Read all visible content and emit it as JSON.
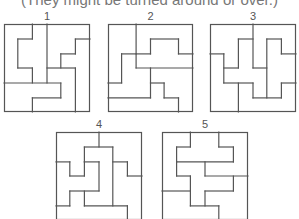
{
  "caption": "(They might be turned around or over.)",
  "line_color": "#555555",
  "puzzles": [
    {
      "label": "1",
      "box": {
        "x": 4,
        "y": 24,
        "w": 86,
        "h": 88
      },
      "lines": [
        [
          33,
          0,
          33,
          17
        ],
        [
          16,
          17,
          33,
          17
        ],
        [
          16,
          17,
          16,
          50
        ],
        [
          16,
          50,
          33,
          50
        ],
        [
          33,
          50,
          33,
          67
        ],
        [
          50,
          0,
          50,
          67
        ],
        [
          0,
          67,
          66,
          67
        ],
        [
          66,
          67,
          66,
          84
        ],
        [
          33,
          84,
          66,
          84
        ],
        [
          33,
          84,
          33,
          100
        ],
        [
          50,
          50,
          83,
          50
        ],
        [
          83,
          50,
          83,
          100
        ],
        [
          83,
          17,
          100,
          17
        ],
        [
          83,
          17,
          83,
          34
        ],
        [
          66,
          34,
          83,
          34
        ],
        [
          66,
          34,
          66,
          50
        ]
      ]
    },
    {
      "label": "2",
      "box": {
        "x": 108,
        "y": 24,
        "w": 85,
        "h": 88
      },
      "lines": [
        [
          33,
          0,
          33,
          50
        ],
        [
          33,
          50,
          100,
          50
        ],
        [
          50,
          17,
          83,
          17
        ],
        [
          50,
          17,
          50,
          34
        ],
        [
          33,
          34,
          50,
          34
        ],
        [
          16,
          34,
          33,
          34
        ],
        [
          16,
          34,
          16,
          67
        ],
        [
          0,
          67,
          16,
          67
        ],
        [
          83,
          17,
          83,
          34
        ],
        [
          83,
          34,
          100,
          34
        ],
        [
          50,
          50,
          50,
          84
        ],
        [
          0,
          84,
          50,
          84
        ],
        [
          50,
          67,
          66,
          67
        ],
        [
          66,
          67,
          66,
          84
        ],
        [
          66,
          84,
          83,
          84
        ],
        [
          83,
          84,
          83,
          100
        ]
      ]
    },
    {
      "label": "3",
      "box": {
        "x": 210,
        "y": 24,
        "w": 86,
        "h": 88
      },
      "lines": [
        [
          50,
          0,
          50,
          50
        ],
        [
          0,
          34,
          16,
          34
        ],
        [
          16,
          34,
          16,
          67
        ],
        [
          16,
          67,
          50,
          67
        ],
        [
          50,
          67,
          50,
          84
        ],
        [
          50,
          84,
          83,
          84
        ],
        [
          83,
          67,
          83,
          84
        ],
        [
          83,
          67,
          100,
          67
        ],
        [
          33,
          67,
          33,
          100
        ],
        [
          16,
          50,
          33,
          50
        ],
        [
          33,
          17,
          33,
          50
        ],
        [
          33,
          17,
          50,
          17
        ],
        [
          50,
          50,
          66,
          50
        ],
        [
          66,
          17,
          66,
          84
        ],
        [
          66,
          17,
          83,
          17
        ],
        [
          83,
          17,
          83,
          34
        ],
        [
          83,
          34,
          100,
          34
        ]
      ]
    },
    {
      "label": "4",
      "box": {
        "x": 56,
        "y": 132,
        "w": 86,
        "h": 88
      },
      "lines": [
        [
          50,
          0,
          50,
          17
        ],
        [
          33,
          17,
          66,
          17
        ],
        [
          33,
          17,
          33,
          34
        ],
        [
          66,
          17,
          66,
          84
        ],
        [
          0,
          34,
          16,
          34
        ],
        [
          16,
          34,
          16,
          50
        ],
        [
          16,
          50,
          33,
          50
        ],
        [
          33,
          34,
          33,
          50
        ],
        [
          33,
          34,
          50,
          34
        ],
        [
          50,
          34,
          50,
          67
        ],
        [
          16,
          67,
          50,
          67
        ],
        [
          16,
          67,
          16,
          84
        ],
        [
          0,
          84,
          16,
          84
        ],
        [
          33,
          67,
          33,
          84
        ],
        [
          33,
          84,
          83,
          84
        ],
        [
          83,
          84,
          83,
          100
        ],
        [
          66,
          34,
          83,
          34
        ],
        [
          83,
          34,
          83,
          50
        ],
        [
          83,
          50,
          100,
          50
        ]
      ]
    },
    {
      "label": "5",
      "box": {
        "x": 162,
        "y": 132,
        "w": 86,
        "h": 88
      },
      "lines": [
        [
          33,
          0,
          33,
          17
        ],
        [
          66,
          0,
          66,
          17
        ],
        [
          17,
          17,
          33,
          17
        ],
        [
          66,
          17,
          83,
          17
        ],
        [
          17,
          17,
          17,
          34
        ],
        [
          83,
          17,
          83,
          34
        ],
        [
          17,
          34,
          83,
          34
        ],
        [
          17,
          34,
          17,
          50
        ],
        [
          17,
          50,
          33,
          50
        ],
        [
          33,
          50,
          33,
          84
        ],
        [
          50,
          34,
          50,
          50
        ],
        [
          50,
          50,
          100,
          50
        ],
        [
          83,
          50,
          83,
          67
        ],
        [
          50,
          67,
          83,
          67
        ],
        [
          50,
          67,
          50,
          84
        ],
        [
          33,
          84,
          66,
          84
        ],
        [
          66,
          84,
          66,
          100
        ],
        [
          0,
          67,
          33,
          67
        ]
      ]
    }
  ]
}
